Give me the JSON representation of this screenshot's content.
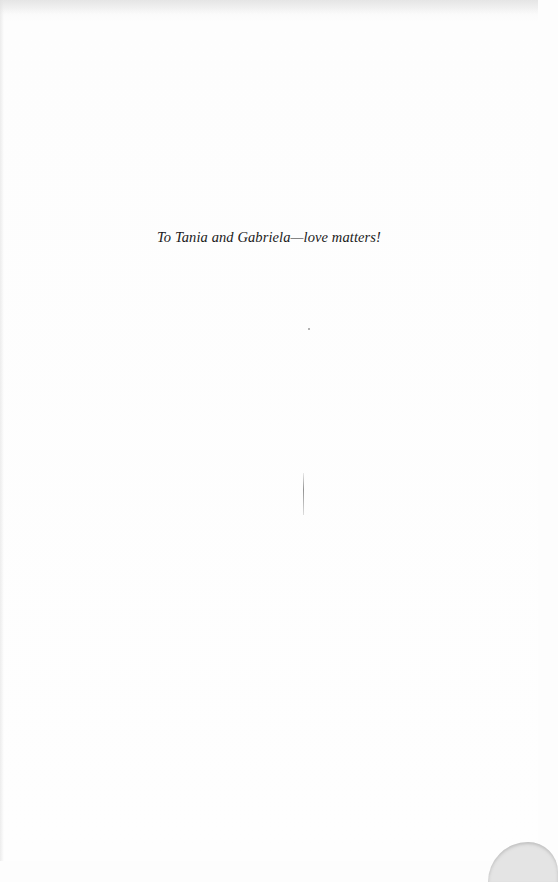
{
  "page": {
    "type": "dedication",
    "dedication_text": "To Tania and Gabriela—love matters!"
  },
  "colors": {
    "paper": "#fdfdfd",
    "text": "#1a1a1a"
  }
}
